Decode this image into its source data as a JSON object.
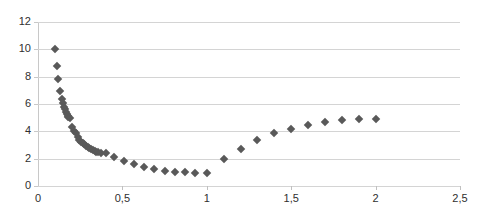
{
  "chart_data": {
    "type": "scatter",
    "title": "",
    "subtitle": "",
    "xlabel": "",
    "ylabel": "",
    "xlim": [
      0,
      2.5
    ],
    "ylim": [
      0,
      12
    ],
    "grid": true,
    "grid_axis": "y",
    "legend": false,
    "legend_position": "none",
    "marker_shape": "diamond",
    "marker_color": "#595959",
    "decimal_separator": ",",
    "xticks": [
      0,
      0.5,
      1,
      1.5,
      2,
      2.5
    ],
    "xticklabels": [
      "0",
      "0,5",
      "1",
      "1,5",
      "2",
      "2,5"
    ],
    "yticks": [
      0,
      2,
      4,
      6,
      8,
      10,
      12
    ],
    "yticklabels": [
      "0",
      "2",
      "4",
      "6",
      "8",
      "10",
      "12"
    ],
    "series": [
      {
        "name": "series1",
        "points": [
          [
            0.1,
            10.0
          ],
          [
            0.11,
            8.8
          ],
          [
            0.12,
            7.8
          ],
          [
            0.13,
            6.95
          ],
          [
            0.14,
            6.35
          ],
          [
            0.15,
            6.05
          ],
          [
            0.155,
            5.8
          ],
          [
            0.16,
            5.6
          ],
          [
            0.165,
            5.45
          ],
          [
            0.17,
            5.3
          ],
          [
            0.175,
            5.15
          ],
          [
            0.18,
            5.05
          ],
          [
            0.19,
            4.95
          ],
          [
            0.2,
            4.35
          ],
          [
            0.215,
            4.05
          ],
          [
            0.225,
            3.9
          ],
          [
            0.235,
            3.55
          ],
          [
            0.245,
            3.4
          ],
          [
            0.255,
            3.25
          ],
          [
            0.265,
            3.15
          ],
          [
            0.275,
            3.05
          ],
          [
            0.285,
            2.95
          ],
          [
            0.295,
            2.85
          ],
          [
            0.305,
            2.78
          ],
          [
            0.315,
            2.7
          ],
          [
            0.325,
            2.62
          ],
          [
            0.335,
            2.58
          ],
          [
            0.345,
            2.52
          ],
          [
            0.355,
            2.5
          ],
          [
            0.375,
            2.45
          ],
          [
            0.4,
            2.42
          ],
          [
            0.45,
            2.1
          ],
          [
            0.51,
            1.82
          ],
          [
            0.57,
            1.6
          ],
          [
            0.63,
            1.42
          ],
          [
            0.69,
            1.28
          ],
          [
            0.75,
            1.12
          ],
          [
            0.81,
            1.05
          ],
          [
            0.87,
            1.0
          ],
          [
            0.93,
            0.96
          ],
          [
            1.0,
            0.96
          ],
          [
            1.1,
            1.95
          ],
          [
            1.2,
            2.7
          ],
          [
            1.3,
            3.35
          ],
          [
            1.4,
            3.85
          ],
          [
            1.5,
            4.2
          ],
          [
            1.6,
            4.48
          ],
          [
            1.7,
            4.66
          ],
          [
            1.8,
            4.8
          ],
          [
            1.9,
            4.88
          ],
          [
            2.0,
            4.9
          ]
        ]
      }
    ]
  }
}
